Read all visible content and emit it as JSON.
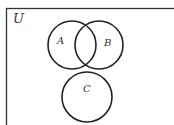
{
  "diagram": {
    "type": "venn",
    "universe_label": "U",
    "sets": [
      {
        "id": "A",
        "label": "A",
        "cx": 72,
        "cy": 45,
        "r": 24
      },
      {
        "id": "B",
        "label": "B",
        "cx": 99,
        "cy": 45,
        "r": 24
      },
      {
        "id": "C",
        "label": "C",
        "cx": 87,
        "cy": 97,
        "r": 25
      }
    ],
    "relations": {
      "A_B": "overlapping",
      "A_C": "disjoint",
      "B_C": "disjoint"
    },
    "colors": {
      "stroke": "#222222",
      "background": "#ffffff"
    }
  }
}
